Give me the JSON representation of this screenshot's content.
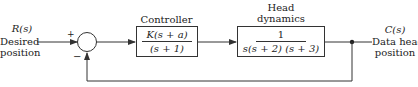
{
  "input": {
    "signal": "R(s)",
    "label_line1": "Desired",
    "label_line2": "position"
  },
  "summing_junction": {
    "plus_sign": "+",
    "minus_sign": "−"
  },
  "controller": {
    "title": "Controller",
    "numerator": "K(s + a)",
    "denominator": "(s + 1)"
  },
  "plant": {
    "title_line1": "Head",
    "title_line2": "dynamics",
    "numerator": "1",
    "denominator": "s(s + 2) (s + 3)"
  },
  "output": {
    "signal": "C(s)",
    "label_line1": "Data head",
    "label_line2": "position"
  },
  "colors": {
    "line": "#333333",
    "background": "#ffffff"
  }
}
